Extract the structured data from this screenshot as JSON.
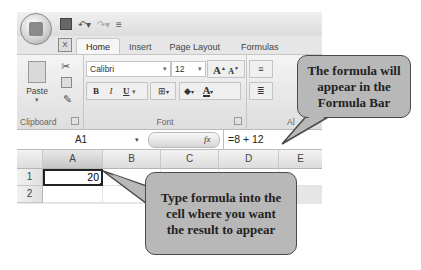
{
  "quick_access": {
    "items": [
      "save-icon",
      "undo-icon",
      "redo-icon",
      "customize-icon"
    ]
  },
  "tabs": [
    {
      "label": "Home",
      "active": true
    },
    {
      "label": "Insert",
      "active": false
    },
    {
      "label": "Page Layout",
      "active": false
    },
    {
      "label": "Formulas",
      "active": false
    }
  ],
  "ribbon": {
    "clipboard": {
      "label": "Clipboard",
      "paste_label": "Paste"
    },
    "font": {
      "label": "Font",
      "font_name": "Calibri",
      "font_size": "12",
      "grow_label": "A",
      "shrink_label": "A",
      "bold": "B",
      "italic": "I",
      "underline": "U",
      "font_color": "A"
    },
    "alignment": {
      "label": "Al"
    }
  },
  "formula_bar": {
    "name_box": "A1",
    "fx_label": "fx",
    "formula": "=8 + 12"
  },
  "sheet": {
    "columns": [
      "A",
      "B",
      "C",
      "D",
      "E"
    ],
    "rows": [
      "1",
      "2"
    ],
    "cells": {
      "A1": "20"
    }
  },
  "callouts": {
    "formula_bar_note": "The formula will appear in the Formula Bar",
    "cell_note": "Type formula into the cell where you want the result to appear"
  },
  "colors": {
    "callout_fill": "#b8b8b8",
    "callout_border": "#4a4a4a",
    "ribbon_bg": "#e6e6e6"
  }
}
